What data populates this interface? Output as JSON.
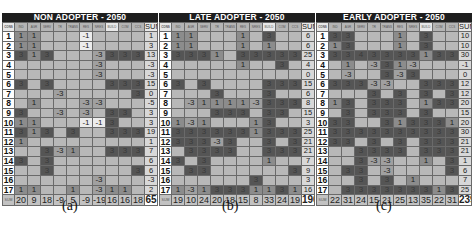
{
  "panels": [
    {
      "title": "NON ADOPTER - 2050",
      "caption": "(a)",
      "header_first": "CONS",
      "columns": [
        "IND",
        "AGR",
        "SERV",
        "TR",
        "TRANS",
        "RES",
        "NRES",
        "BUILD",
        "COM",
        "CCS"
      ],
      "sum_label": "SUM",
      "rows": [
        {
          "id": "1",
          "cells": [
            1,
            1,
            0,
            0,
            0,
            -1,
            0,
            0,
            0,
            0
          ],
          "sum": 1
        },
        {
          "id": "2",
          "cells": [
            1,
            1,
            0,
            0,
            0,
            -1,
            0,
            0,
            0,
            0
          ],
          "sum": 3
        },
        {
          "id": "3",
          "cells": [
            3,
            1,
            3,
            0,
            0,
            0,
            -3,
            3,
            3,
            3
          ],
          "sum": 13
        },
        {
          "id": "4",
          "cells": [
            0,
            0,
            0,
            0,
            0,
            0,
            -3,
            0,
            0,
            0
          ],
          "sum": -3
        },
        {
          "id": "5",
          "cells": [
            0,
            0,
            0,
            0,
            0,
            0,
            -3,
            0,
            0,
            0
          ],
          "sum": -3
        },
        {
          "id": "6",
          "cells": [
            3,
            0,
            3,
            0,
            0,
            0,
            0,
            3,
            3,
            3
          ],
          "sum": 15
        },
        {
          "id": "7",
          "cells": [
            0,
            0,
            0,
            -3,
            0,
            0,
            0,
            0,
            0,
            3
          ],
          "sum": 0
        },
        {
          "id": "8",
          "cells": [
            0,
            1,
            0,
            0,
            0,
            -3,
            -3,
            0,
            0,
            0
          ],
          "sum": -5
        },
        {
          "id": "9",
          "cells": [
            3,
            0,
            0,
            -3,
            0,
            -3,
            0,
            3,
            3,
            0
          ],
          "sum": 3
        },
        {
          "id": "10",
          "cells": [
            1,
            1,
            0,
            0,
            0,
            -1,
            -1,
            3,
            0,
            0
          ],
          "sum": 3
        },
        {
          "id": "11",
          "cells": [
            3,
            1,
            3,
            0,
            3,
            0,
            0,
            3,
            3,
            3
          ],
          "sum": 19
        },
        {
          "id": "12",
          "cells": [
            1,
            0,
            0,
            0,
            0,
            0,
            0,
            0,
            0,
            0
          ],
          "sum": 1
        },
        {
          "id": "13",
          "cells": [
            0,
            0,
            3,
            -3,
            1,
            0,
            0,
            3,
            3,
            3
          ],
          "sum": 7
        },
        {
          "id": "14",
          "cells": [
            3,
            0,
            3,
            0,
            0,
            0,
            0,
            0,
            0,
            0
          ],
          "sum": 6
        },
        {
          "id": "15",
          "cells": [
            0,
            0,
            3,
            0,
            0,
            0,
            0,
            0,
            0,
            3
          ],
          "sum": 6
        },
        {
          "id": "16",
          "cells": [
            0,
            0,
            0,
            0,
            0,
            0,
            -3,
            0,
            0,
            0
          ],
          "sum": -3
        },
        {
          "id": "17",
          "cells": [
            1,
            1,
            0,
            0,
            1,
            0,
            -3,
            1,
            1,
            0
          ],
          "sum": 2
        }
      ],
      "column_sums": [
        20,
        9,
        18,
        -9,
        5,
        -9,
        -19,
        16,
        16,
        18
      ],
      "total": 65
    },
    {
      "title": "LATE ADOPTER - 2050",
      "caption": "(b)",
      "header_first": "CONS",
      "columns": [
        "IND",
        "AGR",
        "SERV",
        "TR",
        "TRANS",
        "RES",
        "NRES",
        "BUILD",
        "COM",
        "CCS"
      ],
      "sum_label": "SUM",
      "rows": [
        {
          "id": "1",
          "cells": [
            1,
            1,
            0,
            0,
            0,
            1,
            0,
            3,
            0,
            0
          ],
          "sum": 6
        },
        {
          "id": "2",
          "cells": [
            1,
            1,
            0,
            0,
            0,
            1,
            0,
            1,
            0,
            0
          ],
          "sum": 6
        },
        {
          "id": "3",
          "cells": [
            3,
            3,
            3,
            1,
            0,
            3,
            3,
            3,
            3,
            3
          ],
          "sum": 25
        },
        {
          "id": "4",
          "cells": [
            0,
            0,
            0,
            0,
            0,
            1,
            0,
            0,
            3,
            0
          ],
          "sum": 4
        },
        {
          "id": "5",
          "cells": [
            0,
            0,
            0,
            0,
            0,
            0,
            0,
            0,
            0,
            0
          ],
          "sum": 0
        },
        {
          "id": "6",
          "cells": [
            3,
            0,
            3,
            0,
            0,
            0,
            0,
            3,
            3,
            3
          ],
          "sum": 15
        },
        {
          "id": "7",
          "cells": [
            0,
            0,
            0,
            3,
            0,
            0,
            0,
            3,
            0,
            0
          ],
          "sum": 6
        },
        {
          "id": "8",
          "cells": [
            0,
            -3,
            1,
            1,
            1,
            1,
            -3,
            3,
            3,
            3
          ],
          "sum": 8
        },
        {
          "id": "9",
          "cells": [
            0,
            0,
            0,
            3,
            3,
            3,
            0,
            3,
            3,
            0
          ],
          "sum": 15
        },
        {
          "id": "10",
          "cells": [
            1,
            -3,
            1,
            0,
            0,
            0,
            1,
            3,
            0,
            0
          ],
          "sum": 3
        },
        {
          "id": "11",
          "cells": [
            3,
            3,
            3,
            3,
            3,
            3,
            1,
            3,
            3,
            3
          ],
          "sum": 25
        },
        {
          "id": "12",
          "cells": [
            3,
            3,
            3,
            -3,
            3,
            0,
            0,
            3,
            0,
            3
          ],
          "sum": 21
        },
        {
          "id": "13",
          "cells": [
            0,
            3,
            3,
            3,
            3,
            0,
            0,
            3,
            3,
            3
          ],
          "sum": 21
        },
        {
          "id": "14",
          "cells": [
            3,
            0,
            3,
            0,
            0,
            0,
            0,
            1,
            0,
            0
          ],
          "sum": 7
        },
        {
          "id": "15",
          "cells": [
            0,
            3,
            3,
            0,
            0,
            0,
            0,
            0,
            0,
            3
          ],
          "sum": 9
        },
        {
          "id": "16",
          "cells": [
            0,
            0,
            0,
            0,
            0,
            0,
            3,
            0,
            0,
            0
          ],
          "sum": 3
        },
        {
          "id": "17",
          "cells": [
            1,
            -3,
            1,
            3,
            3,
            3,
            1,
            1,
            3,
            1
          ],
          "sum": 16
        }
      ],
      "column_sums": [
        19,
        10,
        24,
        20,
        18,
        15,
        8,
        33,
        24,
        19
      ],
      "total": 190
    },
    {
      "title": "EARLY ADOPTER - 2050",
      "caption": "(c)",
      "header_first": "CONS",
      "columns": [
        "IND",
        "AGR",
        "SERV",
        "TR",
        "TRANS",
        "RES",
        "NRES",
        "BUILD",
        "COM",
        "CCS"
      ],
      "sum_label": "SUM",
      "rows": [
        {
          "id": "1",
          "cells": [
            3,
            3,
            0,
            0,
            0,
            1,
            0,
            3,
            0,
            0
          ],
          "sum": 10
        },
        {
          "id": "2",
          "cells": [
            1,
            3,
            0,
            0,
            0,
            1,
            0,
            3,
            0,
            0
          ],
          "sum": 10
        },
        {
          "id": "3",
          "cells": [
            3,
            3,
            4,
            3,
            3,
            3,
            3,
            1,
            3,
            3
          ],
          "sum": 30
        },
        {
          "id": "4",
          "cells": [
            0,
            1,
            0,
            -3,
            3,
            1,
            -3,
            0,
            0,
            0
          ],
          "sum": -1
        },
        {
          "id": "5",
          "cells": [
            0,
            -3,
            0,
            0,
            3,
            -3,
            3,
            0,
            0,
            0
          ],
          "sum": 0
        },
        {
          "id": "6",
          "cells": [
            3,
            3,
            3,
            -3,
            -3,
            0,
            0,
            3,
            3,
            3
          ],
          "sum": 12
        },
        {
          "id": "7",
          "cells": [
            0,
            0,
            0,
            3,
            0,
            3,
            0,
            3,
            0,
            3
          ],
          "sum": 12
        },
        {
          "id": "8",
          "cells": [
            1,
            3,
            0,
            3,
            3,
            3,
            0,
            1,
            3,
            3
          ],
          "sum": 20
        },
        {
          "id": "9",
          "cells": [
            0,
            3,
            0,
            3,
            3,
            3,
            0,
            3,
            0,
            0
          ],
          "sum": 15
        },
        {
          "id": "10",
          "cells": [
            3,
            3,
            0,
            0,
            3,
            1,
            3,
            3,
            3,
            1
          ],
          "sum": 20
        },
        {
          "id": "11",
          "cells": [
            3,
            3,
            3,
            3,
            3,
            3,
            3,
            3,
            3,
            3
          ],
          "sum": 30
        },
        {
          "id": "12",
          "cells": [
            3,
            3,
            0,
            3,
            0,
            3,
            0,
            3,
            3,
            3
          ],
          "sum": 21
        },
        {
          "id": "13",
          "cells": [
            0,
            0,
            3,
            3,
            3,
            3,
            0,
            3,
            3,
            3
          ],
          "sum": 21
        },
        {
          "id": "14",
          "cells": [
            0,
            0,
            3,
            -3,
            -3,
            0,
            0,
            1,
            0,
            3
          ],
          "sum": 1
        },
        {
          "id": "15",
          "cells": [
            0,
            3,
            3,
            0,
            -3,
            0,
            0,
            0,
            0,
            3
          ],
          "sum": 6
        },
        {
          "id": "16",
          "cells": [
            0,
            0,
            3,
            0,
            3,
            0,
            1,
            0,
            0,
            0
          ],
          "sum": 7
        },
        {
          "id": "17",
          "cells": [
            0,
            3,
            3,
            3,
            3,
            3,
            3,
            3,
            1,
            3
          ],
          "sum": 25
        }
      ],
      "column_sums": [
        22,
        31,
        24,
        15,
        21,
        25,
        13,
        35,
        22,
        31
      ],
      "total": 239
    }
  ]
}
